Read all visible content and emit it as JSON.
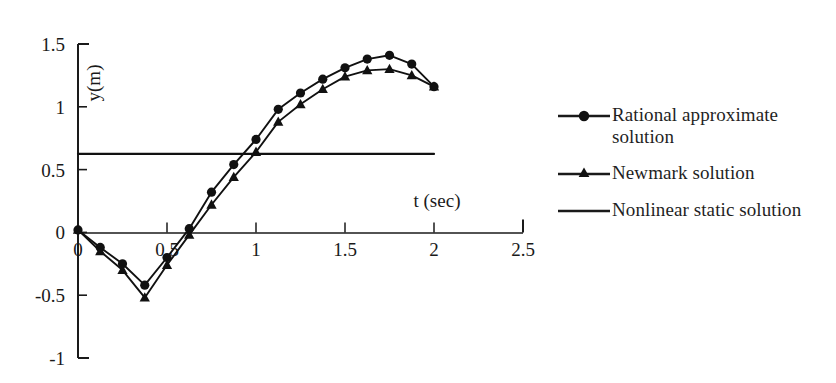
{
  "chart_data": {
    "type": "line",
    "title": "",
    "subtitle": "",
    "xlabel": "t (sec)",
    "ylabel": "y(m)",
    "xlim": [
      0,
      2.5
    ],
    "ylim": [
      -1,
      1.5
    ],
    "xticks": [
      "0",
      "0.5",
      "1",
      "1.5",
      "2",
      "2.5"
    ],
    "xtick_values": [
      0,
      0.5,
      1,
      1.5,
      2,
      2.5
    ],
    "yticks": [
      "1.5",
      "1",
      "0.5",
      "0",
      "-0.5",
      "-1"
    ],
    "ytick_values": [
      1.5,
      1,
      0.5,
      0,
      -0.5,
      -1
    ],
    "grid": false,
    "legend_position": "right",
    "series": [
      {
        "name": "Rational approximate solution",
        "marker": "circle",
        "color": "#111111",
        "x": [
          0.0,
          0.125,
          0.25,
          0.375,
          0.5,
          0.625,
          0.75,
          0.875,
          1.0,
          1.125,
          1.25,
          1.375,
          1.5,
          1.625,
          1.75,
          1.875,
          2.0
        ],
        "y": [
          0.02,
          -0.12,
          -0.25,
          -0.42,
          -0.2,
          0.03,
          0.32,
          0.54,
          0.74,
          0.98,
          1.11,
          1.22,
          1.31,
          1.38,
          1.41,
          1.34,
          1.16
        ]
      },
      {
        "name": "Newmark solution",
        "marker": "triangle",
        "color": "#111111",
        "x": [
          0.0,
          0.125,
          0.25,
          0.375,
          0.5,
          0.625,
          0.75,
          0.875,
          1.0,
          1.125,
          1.25,
          1.375,
          1.5,
          1.625,
          1.75,
          1.875,
          2.0
        ],
        "y": [
          0.02,
          -0.15,
          -0.3,
          -0.52,
          -0.26,
          -0.02,
          0.22,
          0.44,
          0.64,
          0.88,
          1.02,
          1.14,
          1.24,
          1.29,
          1.3,
          1.25,
          1.16
        ]
      },
      {
        "name": "Nonlinear static solution",
        "marker": "none",
        "color": "#111111",
        "x": [
          0.0,
          2.0
        ],
        "y": [
          0.625,
          0.625
        ]
      }
    ],
    "annotations": []
  },
  "legend": {
    "items": [
      {
        "label": "Rational approximate solution",
        "marker": "circle-marker-icon"
      },
      {
        "label": "Newmark solution",
        "marker": "triangle-marker-icon"
      },
      {
        "label": "Nonlinear static solution",
        "marker": "line-marker-icon"
      }
    ]
  },
  "axes": {
    "x_title": "t (sec)",
    "y_title": "y(m)"
  }
}
